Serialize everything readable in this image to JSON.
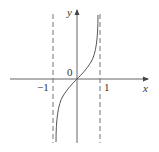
{
  "diagram": {
    "type": "function-graph",
    "axes": {
      "x_label": "x",
      "y_label": "y",
      "origin_label": "0"
    },
    "ticks": {
      "left": "−1",
      "right": "1"
    },
    "asymptotes": [
      {
        "x": -1,
        "style": "dashed"
      },
      {
        "x": 1,
        "style": "dashed"
      }
    ],
    "curve": {
      "description": "increasing curve through origin with vertical asymptotes at x = -1 and x = 1",
      "color": "#555555"
    },
    "colors": {
      "axis": "#555555",
      "dashed": "#777777",
      "text": "#333333"
    }
  }
}
